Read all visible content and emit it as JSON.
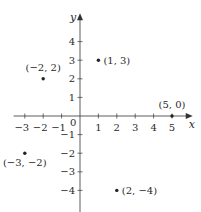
{
  "chart_data": {
    "type": "scatter",
    "title": "",
    "xlabel": "x",
    "ylabel": "y",
    "xlim": [
      -3.5,
      5.8
    ],
    "ylim": [
      -4.8,
      5.2
    ],
    "grid": false,
    "origin_label": "0",
    "x_ticks": [
      -3,
      -2,
      -1,
      1,
      2,
      3,
      4,
      5
    ],
    "x_tick_labels": [
      "−3",
      "−2",
      "−1",
      "1",
      "2",
      "3",
      "4",
      "5"
    ],
    "y_ticks": [
      4,
      3,
      2,
      1,
      -1,
      -2,
      -3,
      -4
    ],
    "y_tick_labels": [
      "4",
      "3",
      "2",
      "1",
      "−1",
      "−2",
      "−3",
      "−4"
    ],
    "points": [
      {
        "x": -2,
        "y": 2,
        "label": "(−2, 2)",
        "label_pos": "above"
      },
      {
        "x": 1,
        "y": 3,
        "label": "(1, 3)",
        "label_pos": "right"
      },
      {
        "x": 5,
        "y": 0,
        "label": "(5, 0)",
        "label_pos": "above"
      },
      {
        "x": -3,
        "y": -2,
        "label": "(−3, −2)",
        "label_pos": "below"
      },
      {
        "x": 2,
        "y": -4,
        "label": "(2, −4)",
        "label_pos": "right"
      }
    ]
  },
  "colors": {
    "axis": "#333333",
    "point": "#222222",
    "text": "#2a2a2a"
  }
}
